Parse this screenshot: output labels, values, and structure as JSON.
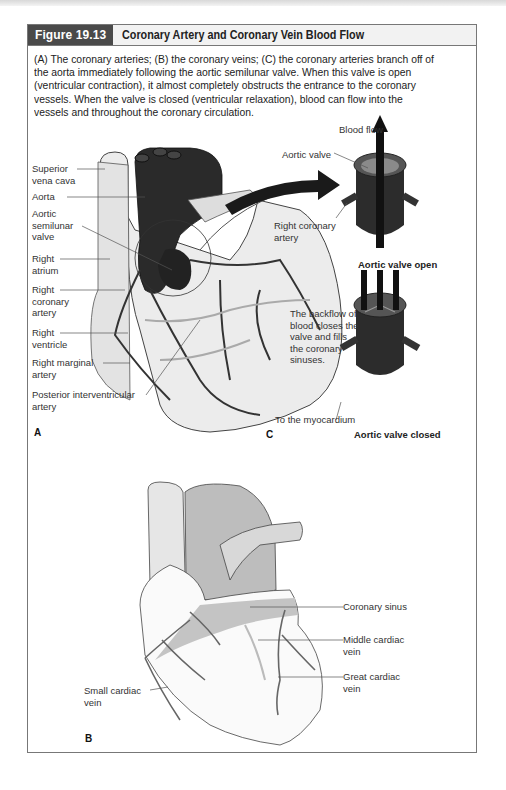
{
  "figure": {
    "number": "Figure 19.13",
    "title": "Coronary Artery and Coronary Vein Blood Flow",
    "caption": "(A) The coronary arteries; (B) the coronary veins; (C) the coronary arteries branch off of the aorta immediately following the aortic semilunar valve. When this valve is open (ventricular contraction), it almost completely obstructs the entrance to the coronary vessels. When the valve is closed (ventricular relaxation), blood can flow into the vessels and throughout the coronary circulation.",
    "colors": {
      "header_dark": "#4a4a4a",
      "header_light": "#f2f2f2",
      "border": "#777777"
    }
  },
  "panel_a": {
    "letter": "A",
    "labels": [
      "Superior\nvena cava",
      "Aorta",
      "Aortic\nsemilunar\nvalve",
      "Right\natrium",
      "Right\ncoronary\nartery",
      "Right\nventricle",
      "Right marginal\nartery",
      "Posterior interventricular\nartery"
    ]
  },
  "panel_c": {
    "letter": "C",
    "labels": {
      "blood_flow": "Blood flow",
      "aortic_valve": "Aortic valve",
      "right_coronary_artery": "Right coronary\nartery",
      "open_caption": "Aortic valve open",
      "backflow": "The backflow of\nblood closes the\nvalve and fills\nthe coronary\nsinuses.",
      "to_myocardium": "To the myocardium",
      "closed_caption": "Aortic valve closed"
    }
  },
  "panel_b": {
    "letter": "B",
    "labels": [
      "Coronary sinus",
      "Middle cardiac\nvein",
      "Great cardiac\nvein",
      "Small cardiac\nvein"
    ]
  }
}
